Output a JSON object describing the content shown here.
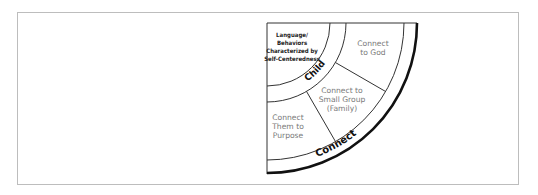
{
  "diagram": {
    "center": [
      267,
      23
    ],
    "radii": {
      "child_inner": 63,
      "child_outer": 79,
      "connect_inner": 137,
      "connect_outer": 150
    },
    "dividers_deg": [
      30,
      60
    ],
    "colors": {
      "stroke": "#333333",
      "label": "#7a7a7a",
      "text_dark": "#111111",
      "frame": "#bdbdbd"
    },
    "core": {
      "lines": [
        "Language/",
        "Behaviors",
        "Characterized by",
        "Self-Centeredness"
      ]
    },
    "child_band": {
      "label": "Child"
    },
    "regions": [
      {
        "id": "god",
        "lines": [
          "Connect",
          "to God"
        ]
      },
      {
        "id": "small-group",
        "lines": [
          "Connect to",
          "Small Group",
          "(Family)"
        ]
      },
      {
        "id": "purpose",
        "lines": [
          "Connect",
          "Them to",
          "Purpose"
        ]
      }
    ],
    "outer_band": {
      "label": "Connect"
    }
  }
}
